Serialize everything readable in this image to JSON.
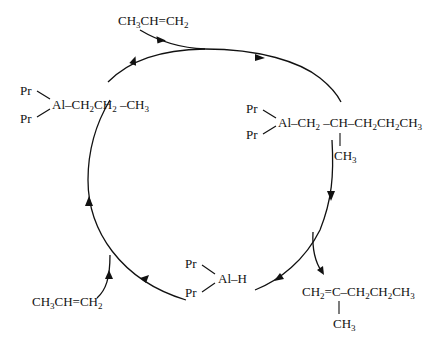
{
  "diagram": {
    "type": "catalytic-cycle",
    "species": {
      "top_reagent": {
        "label": "CH3CH=CH2",
        "parts": [
          "CH",
          "3",
          "CH=CH",
          "2"
        ]
      },
      "left_complex": {
        "ligand_top": "Pr",
        "ligand_bottom": "Pr",
        "chain": "Al–CH2CH2–CH3",
        "parts": [
          "Al–CH",
          "2",
          "CH",
          "2",
          " –CH",
          "3"
        ]
      },
      "right_complex": {
        "ligand_top": "Pr",
        "ligand_bottom": "Pr",
        "chain": "Al–CH2 –CH–CH2CH2CH3",
        "parts": [
          "Al–CH",
          "2",
          " –CH–CH",
          "2",
          "CH",
          "2",
          "CH",
          "3"
        ],
        "branch": "CH3",
        "branch_parts": [
          "CH",
          "3"
        ]
      },
      "hydride": {
        "ligand_top": "Pr",
        "ligand_bottom": "Pr",
        "label": "Al–H"
      },
      "bottom_left_reagent": {
        "label": "CH3CH=CH2",
        "parts": [
          "CH",
          "3",
          "CH=CH",
          "2"
        ]
      },
      "product": {
        "label": "CH2=C–CH2CH2CH3",
        "parts": [
          "CH",
          "2",
          "=C–CH",
          "2",
          "CH",
          "2",
          "CH",
          "3"
        ],
        "branch": "CH3",
        "branch_parts": [
          "CH",
          "3"
        ]
      }
    },
    "flow": "clockwise",
    "steps": [
      "Pr2Al–propyl + propene insertion → Pr2Al–CH2–CH(CH3)–CH2CH2CH3",
      "β-hydride elimination releases CH2=C(CH3)–CH2CH2CH3",
      "Pr2Al–H + propene → Pr2Al–CH2CH2–CH3"
    ]
  }
}
